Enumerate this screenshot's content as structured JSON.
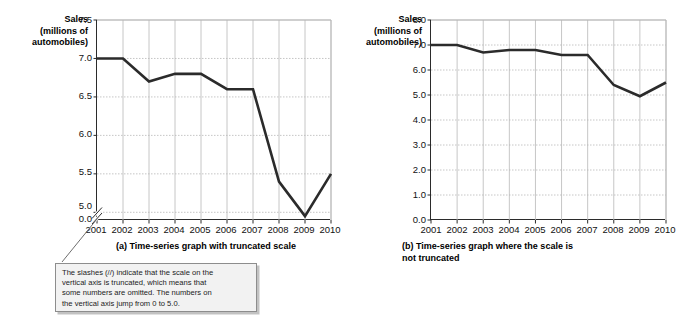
{
  "panel_a": {
    "caption": "(a) Time-series graph with truncated scale",
    "axis_title_line1": "Sales",
    "axis_title_line2": "(millions of",
    "axis_title_line3": "automobiles)"
  },
  "panel_b": {
    "caption_line1": "(b) Time-series graph where the scale is",
    "caption_line2": "not truncated",
    "axis_title_line1": "Sales",
    "axis_title_line2": "(millions of",
    "axis_title_line3": "automobiles)"
  },
  "callout": {
    "line1": "The slashes (//) indicate that the scale on the",
    "line2": "vertical axis is truncated, which means that",
    "line3": "some numbers are omitted.  The numbers on",
    "line4": "the vertical axis jump from 0 to 5.0."
  },
  "colors": {
    "line": "#2b2b2b",
    "axis": "#2b2b2b",
    "grid": "#b8b8b8",
    "callout_fill": "#f2f2f2",
    "callout_border": "#8d8d8d"
  },
  "chart_data": [
    {
      "type": "line",
      "title": "(a) Time-series graph with truncated scale",
      "xlabel": "",
      "ylabel": "Sales (millions of automobiles)",
      "truncated_axis": true,
      "grid": true,
      "legend": "none",
      "categories": [
        "2001",
        "2002",
        "2003",
        "2004",
        "2005",
        "2006",
        "2007",
        "2008",
        "2009",
        "2010"
      ],
      "x": [
        2001,
        2002,
        2003,
        2004,
        2005,
        2006,
        2007,
        2008,
        2009,
        2010
      ],
      "values": [
        7.0,
        7.0,
        6.7,
        6.8,
        6.8,
        6.6,
        6.6,
        5.4,
        4.95,
        5.5
      ],
      "ytick_labels": [
        "0.0",
        "5.0",
        "5.5",
        "6.0",
        "6.5",
        "7.0",
        "7.5"
      ],
      "ytick_values": [
        0.0,
        5.0,
        5.5,
        6.0,
        6.5,
        7.0,
        7.5
      ],
      "ylim": [
        4.9,
        7.5
      ],
      "xlim": [
        2001,
        2010
      ]
    },
    {
      "type": "line",
      "title": "(b) Time-series graph where the scale is not truncated",
      "xlabel": "",
      "ylabel": "Sales (millions of automobiles)",
      "truncated_axis": false,
      "grid": true,
      "legend": "none",
      "categories": [
        "2001",
        "2002",
        "2003",
        "2004",
        "2005",
        "2006",
        "2007",
        "2008",
        "2009",
        "2010"
      ],
      "x": [
        2001,
        2002,
        2003,
        2004,
        2005,
        2006,
        2007,
        2008,
        2009,
        2010
      ],
      "values": [
        7.0,
        7.0,
        6.7,
        6.8,
        6.8,
        6.6,
        6.6,
        5.4,
        4.95,
        5.5
      ],
      "ytick_labels": [
        "0.0",
        "1.0",
        "2.0",
        "3.0",
        "4.0",
        "5.0",
        "6.0",
        "7.0",
        "8.0"
      ],
      "ytick_values": [
        0.0,
        1.0,
        2.0,
        3.0,
        4.0,
        5.0,
        6.0,
        7.0,
        8.0
      ],
      "ylim": [
        0.0,
        8.0
      ],
      "xlim": [
        2001,
        2010
      ]
    }
  ]
}
